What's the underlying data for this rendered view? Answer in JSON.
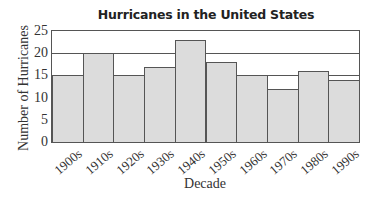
{
  "chart_data": {
    "type": "bar",
    "title": "Hurricanes in the United States",
    "xlabel": "Decade",
    "ylabel": "Number of Hurricanes",
    "categories": [
      "1900s",
      "1910s",
      "1920s",
      "1930s",
      "1940s",
      "1950s",
      "1960s",
      "1970s",
      "1980s",
      "1990s"
    ],
    "values": [
      15,
      20,
      15,
      17,
      23,
      18,
      15,
      12,
      16,
      14
    ],
    "ylim": [
      0,
      25
    ],
    "yticks": [
      0,
      5,
      10,
      15,
      20,
      25
    ],
    "gridlines_at": [
      15,
      20
    ],
    "grid": true,
    "legend": null,
    "colors": {
      "bar_fill": "#dcdcdc",
      "bar_edge": "#555555"
    }
  }
}
